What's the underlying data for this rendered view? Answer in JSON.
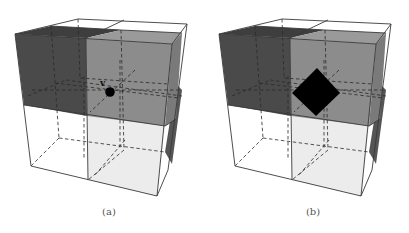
{
  "figure": {
    "panels": [
      {
        "id": "a",
        "caption": "(a)",
        "marker": {
          "type": "vertex-dot",
          "label": "v",
          "color": "#000000"
        },
        "colors": {
          "dark_block": "#4a4a4a",
          "gray_block": "#8c8c8c",
          "light_block": "#ececec",
          "empty_block": "#ffffff",
          "side_strip": "#555555"
        }
      },
      {
        "id": "b",
        "caption": "(b)",
        "marker": {
          "type": "diamond",
          "color": "#000000"
        },
        "colors": {
          "dark_block": "#4a4a4a",
          "gray_block": "#8c8c8c",
          "light_block": "#ececec",
          "empty_block": "#ffffff",
          "side_strip": "#555555"
        }
      }
    ]
  }
}
